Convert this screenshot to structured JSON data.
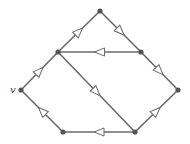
{
  "diagram": {
    "type": "directed-graph",
    "colors": {
      "edge": "#6a6a6a",
      "node": "#555555",
      "arrow_fill": "#ffffff"
    },
    "nodes": [
      {
        "id": "v",
        "label": "v",
        "x": 21,
        "y": 90
      },
      {
        "id": "a",
        "label": "",
        "x": 58,
        "y": 52
      },
      {
        "id": "top",
        "label": "",
        "x": 100,
        "y": 11
      },
      {
        "id": "b",
        "label": "",
        "x": 141,
        "y": 52
      },
      {
        "id": "right",
        "label": "",
        "x": 178,
        "y": 90
      },
      {
        "id": "br",
        "label": "",
        "x": 135,
        "y": 132
      },
      {
        "id": "bl",
        "label": "",
        "x": 63,
        "y": 132
      }
    ],
    "edges": [
      {
        "from": "v",
        "to": "a"
      },
      {
        "from": "a",
        "to": "top"
      },
      {
        "from": "top",
        "to": "b"
      },
      {
        "from": "b",
        "to": "a"
      },
      {
        "from": "b",
        "to": "right"
      },
      {
        "from": "a",
        "to": "br"
      },
      {
        "from": "br",
        "to": "right"
      },
      {
        "from": "br",
        "to": "bl"
      },
      {
        "from": "bl",
        "to": "v"
      }
    ]
  }
}
